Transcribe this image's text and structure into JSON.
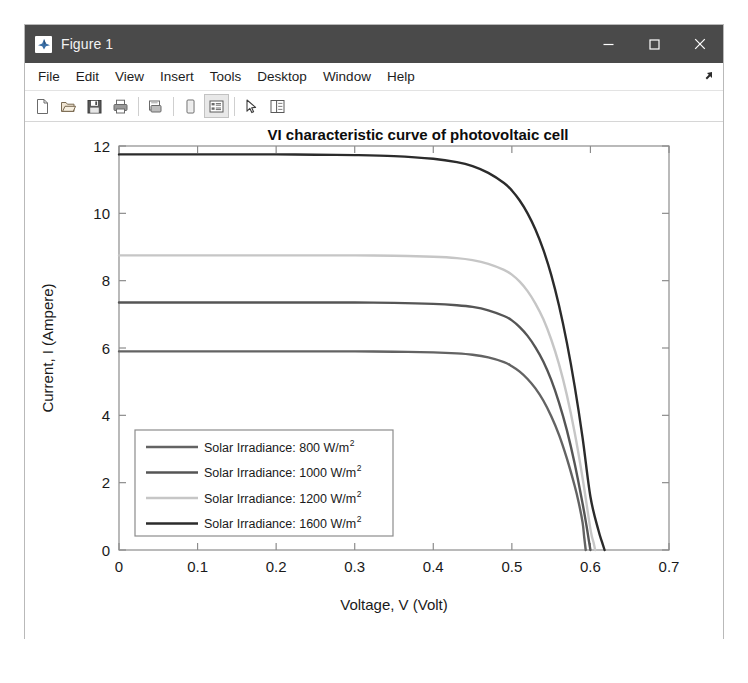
{
  "window": {
    "title": "Figure 1",
    "icon": "matlab-logo-icon",
    "controls": {
      "minimize": "minimize-icon",
      "maximize": "maximize-icon",
      "close": "close-icon"
    }
  },
  "menubar": {
    "items": [
      {
        "label": "File"
      },
      {
        "label": "Edit"
      },
      {
        "label": "View"
      },
      {
        "label": "Insert"
      },
      {
        "label": "Tools"
      },
      {
        "label": "Desktop"
      },
      {
        "label": "Window"
      },
      {
        "label": "Help"
      }
    ],
    "dock_control": "undock-arrow-icon"
  },
  "toolbar": {
    "buttons": [
      {
        "name": "new-figure-icon",
        "pressed": false
      },
      {
        "name": "open-file-icon",
        "pressed": false
      },
      {
        "name": "save-figure-icon",
        "pressed": false
      },
      {
        "name": "print-figure-icon",
        "pressed": false
      },
      {
        "name": "print-preview-icon",
        "pressed": false
      },
      {
        "name": "insert-colorbar-icon",
        "pressed": false
      },
      {
        "name": "insert-legend-icon",
        "pressed": true
      },
      {
        "name": "edit-plot-pointer-icon",
        "pressed": false
      },
      {
        "name": "show-plot-tools-icon",
        "pressed": false
      }
    ]
  },
  "chart_data": {
    "type": "line",
    "title": "VI characteristic curve of photovoltaic cell",
    "xlabel": "Voltage, V (Volt)",
    "ylabel": "Current, I (Ampere)",
    "xlim": [
      0,
      0.7
    ],
    "ylim": [
      0,
      12
    ],
    "xticks": [
      "0",
      "0.1",
      "0.2",
      "0.3",
      "0.4",
      "0.5",
      "0.6",
      "0.7"
    ],
    "xtick_values": [
      0,
      0.1,
      0.2,
      0.3,
      0.4,
      0.5,
      0.6,
      0.7
    ],
    "yticks": [
      "0",
      "2",
      "4",
      "6",
      "8",
      "10",
      "12"
    ],
    "ytick_values": [
      0,
      2,
      4,
      6,
      8,
      10,
      12
    ],
    "grid": false,
    "legend_position": "lower left",
    "series": [
      {
        "name": "Solar Irradiance: 800 W/m",
        "exponent": "2",
        "color": "#636363",
        "isc": 5.9,
        "voc": 0.592,
        "knee_v": 0.47,
        "points": [
          [
            0.0,
            5.9
          ],
          [
            0.05,
            5.9
          ],
          [
            0.1,
            5.9
          ],
          [
            0.15,
            5.9
          ],
          [
            0.2,
            5.9
          ],
          [
            0.25,
            5.9
          ],
          [
            0.3,
            5.9
          ],
          [
            0.35,
            5.89
          ],
          [
            0.4,
            5.87
          ],
          [
            0.43,
            5.84
          ],
          [
            0.45,
            5.8
          ],
          [
            0.47,
            5.72
          ],
          [
            0.49,
            5.58
          ],
          [
            0.5,
            5.46
          ],
          [
            0.51,
            5.3
          ],
          [
            0.52,
            5.08
          ],
          [
            0.53,
            4.8
          ],
          [
            0.54,
            4.44
          ],
          [
            0.55,
            3.98
          ],
          [
            0.56,
            3.42
          ],
          [
            0.57,
            2.72
          ],
          [
            0.58,
            1.9
          ],
          [
            0.585,
            1.42
          ],
          [
            0.59,
            0.82
          ],
          [
            0.592,
            0.4
          ],
          [
            0.594,
            0.0
          ]
        ]
      },
      {
        "name": "Solar Irradiance: 1000 W/m",
        "exponent": "2",
        "color": "#555555",
        "isc": 7.35,
        "voc": 0.6,
        "knee_v": 0.475,
        "points": [
          [
            0.0,
            7.35
          ],
          [
            0.05,
            7.35
          ],
          [
            0.1,
            7.35
          ],
          [
            0.15,
            7.35
          ],
          [
            0.2,
            7.35
          ],
          [
            0.25,
            7.35
          ],
          [
            0.3,
            7.35
          ],
          [
            0.35,
            7.34
          ],
          [
            0.4,
            7.31
          ],
          [
            0.43,
            7.27
          ],
          [
            0.45,
            7.22
          ],
          [
            0.47,
            7.12
          ],
          [
            0.49,
            6.95
          ],
          [
            0.5,
            6.82
          ],
          [
            0.51,
            6.62
          ],
          [
            0.52,
            6.36
          ],
          [
            0.53,
            6.02
          ],
          [
            0.54,
            5.6
          ],
          [
            0.55,
            5.06
          ],
          [
            0.56,
            4.38
          ],
          [
            0.57,
            3.56
          ],
          [
            0.58,
            2.56
          ],
          [
            0.59,
            1.38
          ],
          [
            0.595,
            0.72
          ],
          [
            0.598,
            0.28
          ],
          [
            0.6,
            0.0
          ]
        ]
      },
      {
        "name": "Solar Irradiance: 1200 W/m",
        "exponent": "2",
        "color": "#c6c6c6",
        "isc": 8.75,
        "voc": 0.606,
        "knee_v": 0.48,
        "points": [
          [
            0.0,
            8.75
          ],
          [
            0.05,
            8.75
          ],
          [
            0.1,
            8.75
          ],
          [
            0.15,
            8.75
          ],
          [
            0.2,
            8.75
          ],
          [
            0.25,
            8.75
          ],
          [
            0.3,
            8.75
          ],
          [
            0.35,
            8.74
          ],
          [
            0.4,
            8.71
          ],
          [
            0.43,
            8.67
          ],
          [
            0.45,
            8.61
          ],
          [
            0.47,
            8.5
          ],
          [
            0.49,
            8.32
          ],
          [
            0.5,
            8.18
          ],
          [
            0.51,
            7.97
          ],
          [
            0.52,
            7.69
          ],
          [
            0.53,
            7.32
          ],
          [
            0.54,
            6.86
          ],
          [
            0.55,
            6.26
          ],
          [
            0.56,
            5.52
          ],
          [
            0.57,
            4.6
          ],
          [
            0.58,
            3.48
          ],
          [
            0.59,
            2.14
          ],
          [
            0.6,
            0.62
          ],
          [
            0.604,
            0.22
          ],
          [
            0.606,
            0.0
          ]
        ]
      },
      {
        "name": "Solar Irradiance: 1600 W/m",
        "exponent": "2",
        "color": "#2b2b2b",
        "isc": 11.75,
        "voc": 0.618,
        "knee_v": 0.45,
        "points": [
          [
            0.0,
            11.75
          ],
          [
            0.05,
            11.75
          ],
          [
            0.1,
            11.75
          ],
          [
            0.15,
            11.75
          ],
          [
            0.2,
            11.75
          ],
          [
            0.25,
            11.74
          ],
          [
            0.3,
            11.73
          ],
          [
            0.35,
            11.7
          ],
          [
            0.4,
            11.62
          ],
          [
            0.43,
            11.52
          ],
          [
            0.45,
            11.4
          ],
          [
            0.47,
            11.2
          ],
          [
            0.49,
            10.9
          ],
          [
            0.5,
            10.68
          ],
          [
            0.51,
            10.38
          ],
          [
            0.52,
            10.0
          ],
          [
            0.53,
            9.52
          ],
          [
            0.54,
            8.92
          ],
          [
            0.55,
            8.18
          ],
          [
            0.56,
            7.26
          ],
          [
            0.57,
            6.16
          ],
          [
            0.58,
            4.86
          ],
          [
            0.59,
            3.34
          ],
          [
            0.6,
            1.58
          ],
          [
            0.61,
            0.6
          ],
          [
            0.615,
            0.22
          ],
          [
            0.618,
            0.0
          ]
        ]
      }
    ]
  }
}
